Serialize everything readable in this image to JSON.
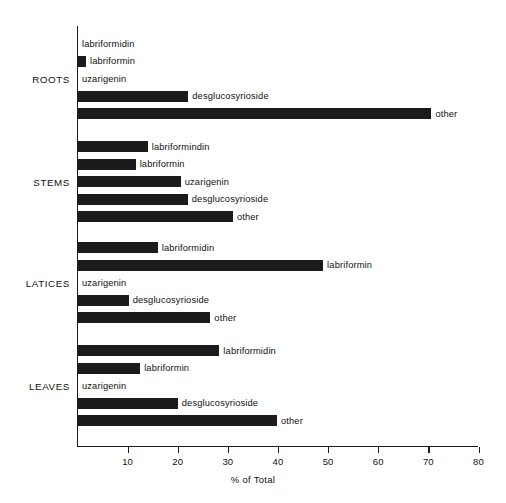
{
  "chart_data": {
    "type": "bar",
    "orientation": "horizontal",
    "title": "",
    "xlabel": "% of Total",
    "ylabel": "",
    "xlim": [
      0,
      80
    ],
    "xticks": [
      10,
      20,
      30,
      40,
      50,
      60,
      70,
      80
    ],
    "grid": false,
    "legend": false,
    "bar_color": "#1b1b1b",
    "categories": [
      "ROOTS",
      "STEMS",
      "LATICES",
      "LEAVES"
    ],
    "groups": [
      {
        "name": "ROOTS",
        "bars": [
          {
            "label": "labriformidin",
            "value": 0.0
          },
          {
            "label": "labriformin",
            "value": 1.6
          },
          {
            "label": "uzarigenin",
            "value": 0.0
          },
          {
            "label": "desglucosyrioside",
            "value": 22.0
          },
          {
            "label": "other",
            "value": 70.5
          }
        ]
      },
      {
        "name": "STEMS",
        "bars": [
          {
            "label": "labriformindin",
            "value": 13.9
          },
          {
            "label": "labriformin",
            "value": 11.5
          },
          {
            "label": "uzarigenin",
            "value": 20.5
          },
          {
            "label": "desglucosyrioside",
            "value": 21.9
          },
          {
            "label": "other",
            "value": 30.9
          }
        ]
      },
      {
        "name": "LATICES",
        "bars": [
          {
            "label": "labriformidin",
            "value": 15.9
          },
          {
            "label": "labriformin",
            "value": 48.9
          },
          {
            "label": "uzarigenin",
            "value": 0.0
          },
          {
            "label": "desglucosyrioside",
            "value": 10.1
          },
          {
            "label": "other",
            "value": 26.4
          }
        ]
      },
      {
        "name": "LEAVES",
        "bars": [
          {
            "label": "labriformidin",
            "value": 28.2
          },
          {
            "label": "labriformin",
            "value": 12.4
          },
          {
            "label": "uzarigenin",
            "value": 0.0
          },
          {
            "label": "desglucosyrioside",
            "value": 19.9
          },
          {
            "label": "other",
            "value": 39.7
          }
        ]
      }
    ]
  }
}
